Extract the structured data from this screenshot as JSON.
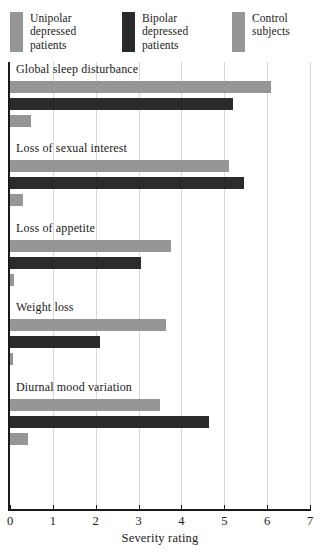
{
  "chart_data": {
    "type": "bar",
    "orientation": "horizontal",
    "title": "",
    "xlabel": "Severity rating",
    "ylabel": "",
    "xlim": [
      0,
      7
    ],
    "xticks": [
      "0",
      "1",
      "2",
      "3",
      "4",
      "5",
      "6",
      "7"
    ],
    "grid": "vertical",
    "legend_position": "top",
    "categories": [
      "Global sleep disturbance",
      "Loss of sexual interest",
      "Loss of appetite",
      "Weight loss",
      "Diurnal mood variation"
    ],
    "series": [
      {
        "name": "Unipolar depressed patients",
        "color": "#969696",
        "values": [
          6.1,
          5.1,
          3.75,
          3.65,
          3.5
        ]
      },
      {
        "name": "Bipolar depressed patients",
        "color": "#2b2b2b",
        "values": [
          5.2,
          5.45,
          3.05,
          2.1,
          4.65
        ]
      },
      {
        "name": "Control subjects",
        "color": "#969696",
        "values": [
          0.5,
          0.3,
          0.1,
          0.08,
          0.42
        ]
      }
    ]
  },
  "legend": {
    "entries": [
      {
        "lines": [
          "Unipolar",
          "depressed",
          "patients"
        ],
        "swatch": "#969696"
      },
      {
        "lines": [
          "Bipolar",
          "depressed",
          "patients"
        ],
        "swatch": "#2b2b2b"
      },
      {
        "lines": [
          "Control",
          "subjects"
        ],
        "swatch": "#969696"
      }
    ]
  },
  "axis": {
    "x_label": "Severity rating",
    "tick_labels": [
      "0",
      "1",
      "2",
      "3",
      "4",
      "5",
      "6",
      "7"
    ]
  }
}
